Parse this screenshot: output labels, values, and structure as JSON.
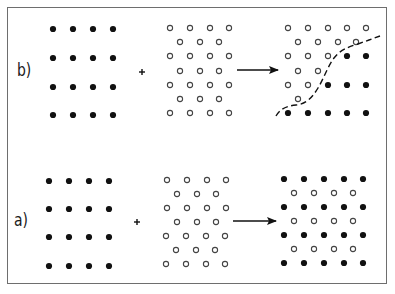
{
  "figure": {
    "panels": [
      {
        "id": "b",
        "label": "b)",
        "label_pos": [
          17,
          62
        ],
        "reactant_filled": {
          "xs": [
            53,
            73,
            93,
            113
          ],
          "ys": [
            29,
            58,
            87,
            115
          ]
        },
        "plus": [
          142,
          72
        ],
        "reactant_open": {
          "rows": [
            {
              "y": 28,
              "xs": [
                170,
                190,
                210,
                229
              ]
            },
            {
              "y": 42,
              "xs": [
                180,
                200,
                219
              ]
            },
            {
              "y": 56,
              "xs": [
                170,
                190,
                210,
                229
              ]
            },
            {
              "y": 71,
              "xs": [
                180,
                200,
                219
              ]
            },
            {
              "y": 85,
              "xs": [
                170,
                190,
                210,
                229
              ]
            },
            {
              "y": 99,
              "xs": [
                180,
                200,
                219
              ]
            },
            {
              "y": 113,
              "xs": [
                170,
                190,
                210,
                229
              ]
            }
          ]
        },
        "arrow": {
          "x1": 237,
          "x2": 278,
          "y": 70
        },
        "product": {
          "rows": [
            {
              "y": 28,
              "items": [
                [
                  "o",
                  288
                ],
                [
                  "o",
                  308
                ],
                [
                  "o",
                  328
                ],
                [
                  "o",
                  347
                ],
                [
                  "o",
                  366
                ]
              ]
            },
            {
              "y": 42,
              "items": [
                [
                  "o",
                  298
                ],
                [
                  "o",
                  318
                ],
                [
                  "o",
                  338
                ],
                [
                  "o",
                  356
                ]
              ]
            },
            {
              "y": 56,
              "items": [
                [
                  "o",
                  288
                ],
                [
                  "o",
                  308
                ],
                [
                  "o",
                  328
                ],
                [
                  "f",
                  347
                ],
                [
                  "f",
                  366
                ]
              ]
            },
            {
              "y": 71,
              "items": [
                [
                  "o",
                  298
                ],
                [
                  "o",
                  318
                ]
              ]
            },
            {
              "y": 85,
              "items": [
                [
                  "o",
                  288
                ],
                [
                  "o",
                  308
                ],
                [
                  "f",
                  328
                ],
                [
                  "f",
                  347
                ],
                [
                  "f",
                  366
                ]
              ]
            },
            {
              "y": 99,
              "items": [
                [
                  "o",
                  298
                ]
              ]
            },
            {
              "y": 113,
              "items": [
                [
                  "f",
                  288
                ],
                [
                  "f",
                  308
                ],
                [
                  "f",
                  328
                ],
                [
                  "f",
                  347
                ],
                [
                  "f",
                  366
                ]
              ]
            }
          ]
        },
        "boundary_curve": "M276,116 C280,109 286,106 296,105 C306,104 312,98 318,88 C324,78 328,66 334,58 C340,50 348,47 358,44 C366,41 372,39 380,36"
      },
      {
        "id": "a",
        "label": "a)",
        "label_pos": [
          14,
          212
        ],
        "reactant_filled": {
          "xs": [
            49,
            69,
            89,
            109
          ],
          "ys": [
            181,
            209,
            237,
            266
          ]
        },
        "plus": [
          137,
          222
        ],
        "reactant_open": {
          "rows": [
            {
              "y": 180,
              "xs": [
                167,
                187,
                207,
                226
              ]
            },
            {
              "y": 194,
              "xs": [
                177,
                197,
                216
              ]
            },
            {
              "y": 208,
              "xs": [
                167,
                187,
                207,
                226
              ]
            },
            {
              "y": 222,
              "xs": [
                177,
                197,
                216
              ]
            },
            {
              "y": 236,
              "xs": [
                166,
                186,
                206,
                225
              ]
            },
            {
              "y": 250,
              "xs": [
                176,
                196,
                215
              ]
            },
            {
              "y": 264,
              "xs": [
                166,
                186,
                206,
                225
              ]
            }
          ]
        },
        "arrow": {
          "x1": 233,
          "x2": 276,
          "y": 221
        },
        "product": {
          "rows": [
            {
              "y": 179,
              "items": [
                [
                  "f",
                  284
                ],
                [
                  "f",
                  304
                ],
                [
                  "f",
                  324
                ],
                [
                  "f",
                  344
                ],
                [
                  "f",
                  363
                ]
              ]
            },
            {
              "y": 193,
              "items": [
                [
                  "o",
                  294
                ],
                [
                  "o",
                  314
                ],
                [
                  "o",
                  334
                ],
                [
                  "o",
                  353
                ]
              ]
            },
            {
              "y": 207,
              "items": [
                [
                  "f",
                  284
                ],
                [
                  "f",
                  304
                ],
                [
                  "f",
                  324
                ],
                [
                  "f",
                  344
                ],
                [
                  "f",
                  363
                ]
              ]
            },
            {
              "y": 221,
              "items": [
                [
                  "o",
                  294
                ],
                [
                  "o",
                  314
                ],
                [
                  "o",
                  334
                ],
                [
                  "o",
                  353
                ]
              ]
            },
            {
              "y": 235,
              "items": [
                [
                  "f",
                  284
                ],
                [
                  "f",
                  304
                ],
                [
                  "f",
                  324
                ],
                [
                  "f",
                  344
                ],
                [
                  "f",
                  363
                ]
              ]
            },
            {
              "y": 249,
              "items": [
                [
                  "o",
                  294
                ],
                [
                  "o",
                  314
                ],
                [
                  "o",
                  334
                ],
                [
                  "o",
                  353
                ]
              ]
            },
            {
              "y": 263,
              "items": [
                [
                  "f",
                  284
                ],
                [
                  "f",
                  304
                ],
                [
                  "f",
                  324
                ],
                [
                  "f",
                  344
                ],
                [
                  "f",
                  363
                ]
              ]
            }
          ]
        }
      }
    ],
    "colors": {
      "ink": "#111111",
      "open_stroke": "#444444",
      "frame": "#6e6e6e"
    }
  }
}
